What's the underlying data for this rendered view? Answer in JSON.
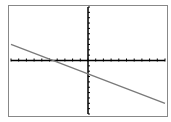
{
  "chart_data": {
    "type": "line",
    "title": "",
    "xlabel": "",
    "ylabel": "",
    "xlim": [
      -10,
      10
    ],
    "ylim": [
      -10,
      10
    ],
    "grid": false,
    "x_tick_step": 1,
    "y_tick_step": 1,
    "series": [
      {
        "name": "y = -0.55x - 2.5",
        "x": [
          -10,
          10
        ],
        "y": [
          3.0,
          -8.0
        ]
      }
    ],
    "colors": {
      "line": "#7a7a7a",
      "axes": "#000000",
      "frame": "#888888"
    }
  }
}
